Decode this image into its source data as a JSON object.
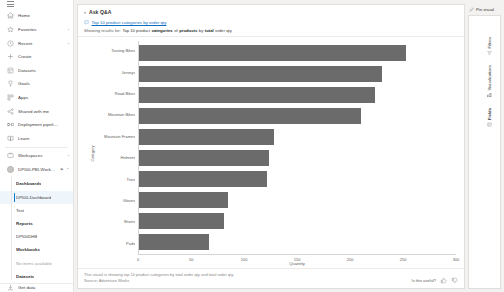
{
  "sidebar": {
    "hamburger_name": "navigation-toggle",
    "items": [
      {
        "label": "Home",
        "icon": "home-icon",
        "chevron": ""
      },
      {
        "label": "Favorites",
        "icon": "star-icon",
        "chevron": "›"
      },
      {
        "label": "Recent",
        "icon": "clock-icon",
        "chevron": "›"
      },
      {
        "label": "Create",
        "icon": "plus-icon",
        "chevron": ""
      },
      {
        "label": "Datasets",
        "icon": "dataset-icon",
        "chevron": ""
      },
      {
        "label": "Goals",
        "icon": "trophy-icon",
        "chevron": ""
      },
      {
        "label": "Apps",
        "icon": "apps-icon",
        "chevron": ""
      },
      {
        "label": "Shared with me",
        "icon": "share-icon",
        "chevron": ""
      },
      {
        "label": "Deployment pipelines",
        "icon": "pipeline-icon",
        "chevron": ""
      },
      {
        "label": "Learn",
        "icon": "book-icon",
        "chevron": ""
      },
      {
        "label": "Workspaces",
        "icon": "workspaces-icon",
        "chevron": "›"
      }
    ],
    "workspace": {
      "name": "DPI00-PBI-Work...",
      "icon": "workspace-avatar",
      "badge": "⚑",
      "collapse": "⌃"
    },
    "tree": [
      {
        "label": "Dashboards",
        "bold": true,
        "selected": false,
        "muted": false
      },
      {
        "label": "DPI00-Dashboard",
        "bold": false,
        "selected": true,
        "muted": false
      },
      {
        "label": "Test",
        "bold": false,
        "selected": false,
        "muted": false
      },
      {
        "label": "Reports",
        "bold": true,
        "selected": false,
        "muted": false
      },
      {
        "label": "DPI00DHB",
        "bold": false,
        "selected": false,
        "muted": false
      },
      {
        "label": "Workbooks",
        "bold": true,
        "selected": false,
        "muted": false
      },
      {
        "label": "No items available",
        "bold": false,
        "selected": false,
        "muted": true
      },
      {
        "label": "Datasets",
        "bold": true,
        "selected": false,
        "muted": false
      }
    ],
    "footer": {
      "label": "Get data",
      "icon": "get-data-icon"
    }
  },
  "qna": {
    "back_icon": "back-chevron-icon",
    "title": "Ask Q&A",
    "query_icon": "qna-question-icon",
    "query_text": "Top 10 product categories by order qty",
    "showing": {
      "lead": "Showing results for:",
      "tokens": [
        {
          "t": "Top 10 product",
          "b": false
        },
        {
          "t": "categories",
          "b": true
        },
        {
          "t": "of",
          "b": false
        },
        {
          "t": "products",
          "b": true
        },
        {
          "t": "by",
          "b": false
        },
        {
          "t": "total",
          "b": true
        },
        {
          "t": "order qty",
          "b": false
        }
      ]
    },
    "footer_description_line1": "This visual is showing top 10 product categories by total order qty and total order qty.",
    "footer_description_line2": "Source: Adventure Works",
    "footer_question": "Is this useful?",
    "thumbs_up_icon": "thumbs-up-icon",
    "thumbs_down_icon": "thumbs-down-icon"
  },
  "right_pane": {
    "pin_icon": "pin-icon",
    "pin_label": "Pin visual",
    "tabs": [
      {
        "label": "Filters",
        "icon": "filter-icon",
        "bold": false
      },
      {
        "label": "Visualizations",
        "icon": "visualizations-icon",
        "bold": false
      },
      {
        "label": "Fields",
        "icon": "fields-icon",
        "bold": true
      }
    ]
  },
  "chart_data": {
    "type": "bar",
    "orientation": "horizontal",
    "title": "",
    "xlabel": "Quantity",
    "ylabel": "Category",
    "xlim": [
      0,
      300
    ],
    "xticks": [
      0,
      50,
      100,
      150,
      200,
      250,
      300
    ],
    "grid": false,
    "legend": false,
    "bar_color": "#6b6b6b",
    "categories": [
      "Touring Bikes",
      "Jerseys",
      "Road Bikes",
      "Mountain Bikes",
      "Mountain Frames",
      "Helmets",
      "Tires",
      "Gloves",
      "Shorts",
      "Pads"
    ],
    "values": [
      253,
      230,
      223,
      210,
      128,
      123,
      121,
      84,
      80,
      66
    ]
  }
}
